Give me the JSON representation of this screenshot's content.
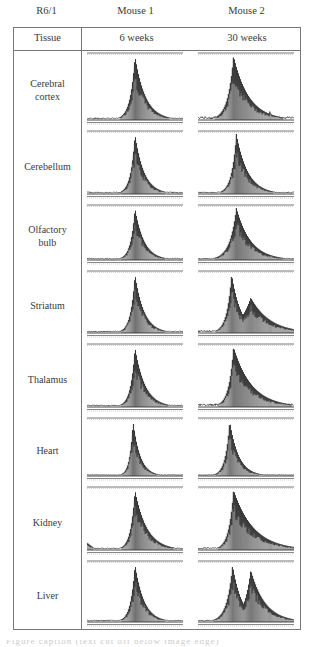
{
  "figure": {
    "corner_label": "R6/1",
    "columns": [
      {
        "mouse": "Mouse 1",
        "age": "6 weeks"
      },
      {
        "mouse": "Mouse 2",
        "age": "30 weeks"
      }
    ],
    "row_header": "Tissue",
    "rows": [
      {
        "tissue": "Cerebral\ncortex",
        "top": 23,
        "height": 78,
        "traces": [
          {
            "peaks": [
              {
                "c": 0.5,
                "h": 1.0,
                "w": 0.05,
                "tail": 0.06
              }
            ],
            "noise": 0.02
          },
          {
            "peaks": [
              {
                "c": 0.37,
                "h": 1.0,
                "w": 0.06,
                "tail": 0.1
              },
              {
                "c": 0.62,
                "h": 0.22,
                "w": 0.012,
                "tail": 0.01
              },
              {
                "c": 0.75,
                "h": 0.17,
                "w": 0.01,
                "tail": 0.005
              }
            ],
            "noise": 0.04
          }
        ]
      },
      {
        "tissue": "Cerebellum",
        "top": 101,
        "height": 74,
        "traces": [
          {
            "peaks": [
              {
                "c": 0.5,
                "h": 1.0,
                "w": 0.045,
                "tail": 0.05
              }
            ],
            "noise": 0.02
          },
          {
            "peaks": [
              {
                "c": 0.4,
                "h": 1.0,
                "w": 0.05,
                "tail": 0.07
              }
            ],
            "noise": 0.02
          }
        ]
      },
      {
        "tissue": "Olfactory\nbulb",
        "top": 175,
        "height": 66,
        "traces": [
          {
            "peaks": [
              {
                "c": 0.5,
                "h": 1.0,
                "w": 0.045,
                "tail": 0.05
              }
            ],
            "noise": 0.02
          },
          {
            "peaks": [
              {
                "c": 0.4,
                "h": 1.0,
                "w": 0.07,
                "tail": 0.08
              }
            ],
            "noise": 0.02
          }
        ]
      },
      {
        "tissue": "Striatum",
        "top": 241,
        "height": 73,
        "traces": [
          {
            "peaks": [
              {
                "c": 0.5,
                "h": 1.0,
                "w": 0.045,
                "tail": 0.05
              }
            ],
            "noise": 0.02
          },
          {
            "peaks": [
              {
                "c": 0.35,
                "h": 1.0,
                "w": 0.05,
                "tail": 0.05
              },
              {
                "c": 0.55,
                "h": 0.6,
                "w": 0.12,
                "tail": 0.08
              }
            ],
            "noise": 0.03
          }
        ]
      },
      {
        "tissue": "Thalamus",
        "top": 314,
        "height": 74,
        "traces": [
          {
            "peaks": [
              {
                "c": 0.5,
                "h": 1.0,
                "w": 0.045,
                "tail": 0.06
              }
            ],
            "noise": 0.02
          },
          {
            "peaks": [
              {
                "c": 0.37,
                "h": 1.0,
                "w": 0.05,
                "tail": 0.14
              }
            ],
            "noise": 0.04
          }
        ]
      },
      {
        "tissue": "Heart",
        "top": 388,
        "height": 69,
        "traces": [
          {
            "peaks": [
              {
                "c": 0.48,
                "h": 1.0,
                "w": 0.035,
                "tail": 0.04
              }
            ],
            "noise": 0.01
          },
          {
            "peaks": [
              {
                "c": 0.33,
                "h": 1.0,
                "w": 0.045,
                "tail": 0.05
              }
            ],
            "noise": 0.01
          }
        ]
      },
      {
        "tissue": "Kidney",
        "top": 457,
        "height": 74,
        "traces": [
          {
            "peaks": [
              {
                "c": 0.5,
                "h": 1.0,
                "w": 0.045,
                "tail": 0.08
              }
            ],
            "noise": 0.02,
            "left_bump": true
          },
          {
            "peaks": [
              {
                "c": 0.37,
                "h": 1.0,
                "w": 0.05,
                "tail": 0.16
              }
            ],
            "noise": 0.03
          }
        ]
      },
      {
        "tissue": "Liver",
        "top": 531,
        "height": 72,
        "traces": [
          {
            "peaks": [
              {
                "c": 0.5,
                "h": 1.0,
                "w": 0.045,
                "tail": 0.05
              }
            ],
            "noise": 0.02
          },
          {
            "peaks": [
              {
                "c": 0.36,
                "h": 0.98,
                "w": 0.06,
                "tail": 0.04
              },
              {
                "c": 0.55,
                "h": 0.9,
                "w": 0.07,
                "tail": 0.08
              }
            ],
            "noise": 0.02
          }
        ]
      }
    ],
    "caption_fragment": "Figure caption (text cut off below image edge)"
  }
}
